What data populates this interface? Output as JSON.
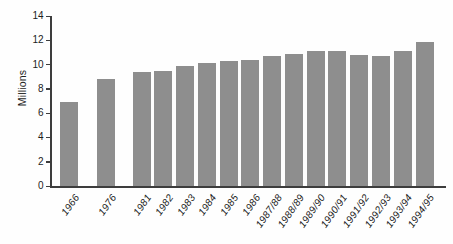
{
  "chart_data": {
    "type": "bar",
    "title": "",
    "xlabel": "",
    "ylabel": "Millions",
    "categories": [
      "1966",
      "1976",
      "1981",
      "1982",
      "1983",
      "1984",
      "1985",
      "1986",
      "1987/88",
      "1988/89",
      "1989/90",
      "1990/91",
      "1991/92",
      "1992/93",
      "1993/94",
      "1994/95"
    ],
    "values": [
      6.9,
      8.8,
      9.4,
      9.5,
      9.9,
      10.1,
      10.3,
      10.4,
      10.7,
      10.9,
      11.1,
      11.1,
      10.8,
      10.7,
      11.1,
      11.9
    ],
    "ylim": [
      0,
      14
    ],
    "yticks": [
      0,
      2,
      4,
      6,
      8,
      10,
      12,
      14
    ],
    "grid": "off",
    "legend": "none",
    "bar_color": "#8e8e8e",
    "axis_color": "#3d3d3d"
  }
}
